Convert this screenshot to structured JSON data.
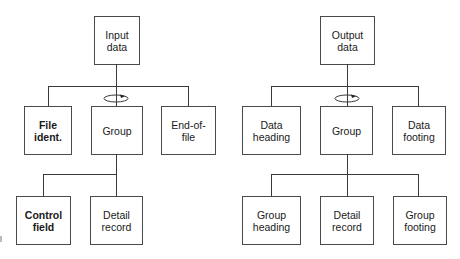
{
  "diagrams": {
    "input": {
      "root": "Input\ndata",
      "loop_label": "iteration-loop",
      "level1": [
        "File\nident.",
        "Group",
        "End-of-\nfile"
      ],
      "level2": [
        "Control\nfield",
        "Detail\nrecord"
      ]
    },
    "output": {
      "root": "Output\ndata",
      "loop_label": "iteration-loop",
      "level1": [
        "Data\nheading",
        "Group",
        "Data\nfooting"
      ],
      "level2": [
        "Group\nheading",
        "Detail\nrecord",
        "Group\nfooting"
      ]
    }
  },
  "colors": {
    "line": "#3a3a3a",
    "border": "#4a4a4a",
    "text": "#1a1a1a",
    "background": "#ffffff"
  }
}
